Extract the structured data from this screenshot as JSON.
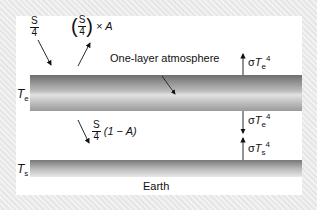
{
  "diagram": {
    "incoming_solar": {
      "numerator": "S",
      "denominator": "4"
    },
    "reflected": {
      "numerator": "S",
      "denominator": "4",
      "suffix": "× A"
    },
    "absorbed_surface": {
      "numerator": "S",
      "denominator": "4",
      "suffix": "(1 − A)"
    },
    "atmosphere_label": "One-layer atmosphere",
    "atmosphere_temp": {
      "symbol": "T",
      "subscript": "e"
    },
    "surface_temp": {
      "symbol": "T",
      "subscript": "s"
    },
    "earth_label": "Earth",
    "flux_up_atm": {
      "sigma": "σ",
      "symbol": "T",
      "subscript": "e",
      "power": "4"
    },
    "flux_down_atm": {
      "sigma": "σ",
      "symbol": "T",
      "subscript": "e",
      "power": "4"
    },
    "flux_up_surface": {
      "sigma": "σ",
      "symbol": "T",
      "subscript": "s",
      "power": "4"
    }
  }
}
